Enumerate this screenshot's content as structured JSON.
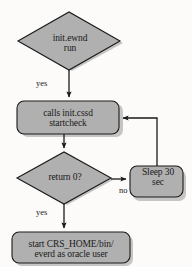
{
  "diagram": {
    "background_color": "#fcfbf9",
    "node_fill_color": "#b0b0b0",
    "node_stroke_color": "#1a1a1a",
    "connector_color": "#1a1a1a",
    "nodes": [
      {
        "id": "start",
        "shape": "decision",
        "label": "init.ewnd\nrun"
      },
      {
        "id": "startcheck",
        "shape": "process",
        "label": "calls init.cssd\nstartcheck"
      },
      {
        "id": "decision",
        "shape": "decision",
        "label": "return 0?"
      },
      {
        "id": "sleep",
        "shape": "process",
        "label": "Sleep 30\nsec"
      },
      {
        "id": "final",
        "shape": "process",
        "label": "start CRS_HOME/bin/\neverd as oracle user"
      }
    ],
    "edges": [
      {
        "id": "start-to-startcheck",
        "from": "start",
        "to": "startcheck",
        "label": "yes"
      },
      {
        "id": "startcheck-to-decision",
        "from": "startcheck",
        "to": "decision",
        "label": ""
      },
      {
        "id": "decision-to-sleep",
        "from": "decision",
        "to": "sleep",
        "label": "no"
      },
      {
        "id": "sleep-to-startcheck",
        "from": "sleep",
        "to": "startcheck",
        "label": ""
      },
      {
        "id": "decision-to-final",
        "from": "decision",
        "to": "final",
        "label": "yes"
      }
    ]
  }
}
